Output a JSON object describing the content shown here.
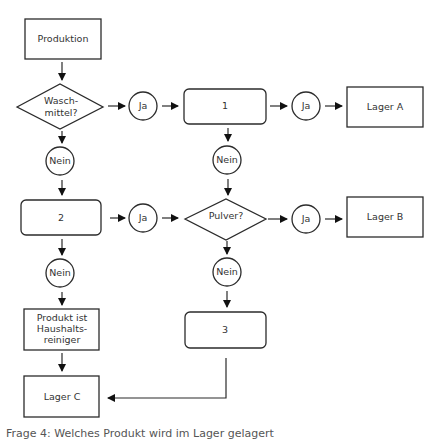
{
  "diagram": {
    "type": "flowchart",
    "nodes": {
      "produktion": {
        "label": "Produktion"
      },
      "waschmittel": {
        "line1": "Wasch-",
        "line2": "mittel?"
      },
      "ja1": {
        "label": "Ja"
      },
      "box1": {
        "label": "1"
      },
      "ja2": {
        "label": "Ja"
      },
      "lagerA": {
        "label": "Lager A"
      },
      "nein1": {
        "label": "Nein"
      },
      "box2": {
        "label": "2"
      },
      "ja3": {
        "label": "Ja"
      },
      "nein2": {
        "label": "Nein"
      },
      "pulver": {
        "label": "Pulver?"
      },
      "ja4": {
        "label": "Ja"
      },
      "lagerB": {
        "label": "Lager B"
      },
      "nein3": {
        "label": "Nein"
      },
      "box3": {
        "label": "3"
      },
      "nein4": {
        "label": "Nein"
      },
      "haushalt": {
        "line1": "Produkt ist",
        "line2": "Haushalts-",
        "line3": "reiniger"
      },
      "lagerC": {
        "label": "Lager C"
      }
    }
  },
  "caption": "Frage 4: Welches Produkt wird im Lager gelagert"
}
